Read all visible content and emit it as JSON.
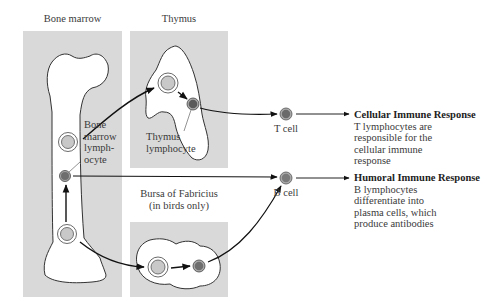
{
  "colors": {
    "panel": "#d9d9d9",
    "organ_fill": "#ffffff",
    "outline": "#333333",
    "stem_cell_fill": "#c8c8c8",
    "mature_cell_fill": "#6e6e6e",
    "arrow": "#111111"
  },
  "panels": {
    "bone_marrow": {
      "title": "Bone marrow",
      "cell_label": [
        "Bone",
        "marrow",
        "lymph-",
        "ocyte"
      ]
    },
    "thymus": {
      "title": "Thymus",
      "cell_label": [
        "Thymus",
        "lymphocyte"
      ]
    },
    "bursa": {
      "title_line1": "Bursa of Fabricius",
      "title_line2": "(in birds only)"
    }
  },
  "cells": {
    "t_cell": {
      "label": "T cell"
    },
    "b_cell": {
      "label": "B cell"
    }
  },
  "responses": {
    "cellular": {
      "heading": "Cellular Immune Response",
      "lines": [
        "T lymphocytes are",
        "responsible for the",
        "cellular immune",
        "response"
      ]
    },
    "humoral": {
      "heading": "Humoral Immune Response",
      "lines": [
        "B lymphocytes",
        "differentiate into",
        "plasma cells, which",
        "produce antibodies"
      ]
    }
  }
}
